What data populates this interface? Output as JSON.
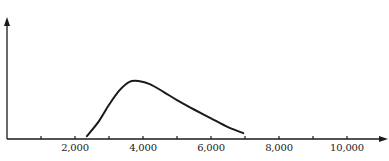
{
  "chart_data": {
    "type": "line",
    "title": "",
    "xlabel": "",
    "ylabel": "",
    "xlim": [
      0,
      11000
    ],
    "ylim": [
      0,
      1
    ],
    "grid": false,
    "legend": null,
    "x_ticks": [
      1000,
      2000,
      3000,
      4000,
      5000,
      6000,
      7000,
      8000,
      9000,
      10000
    ],
    "x_tick_labels": [
      {
        "value": 2000,
        "label": "2,000"
      },
      {
        "value": 4000,
        "label": "4,000"
      },
      {
        "value": 6000,
        "label": "6,000"
      },
      {
        "value": 8000,
        "label": "8,000"
      },
      {
        "value": 10000,
        "label": "10,000"
      }
    ],
    "y_ticks": [],
    "series": [
      {
        "name": "distribution",
        "x": [
          2350,
          2700,
          3000,
          3300,
          3600,
          3900,
          4200,
          4600,
          5000,
          5500,
          6000,
          6500,
          6950
        ],
        "y": [
          0.05,
          0.3,
          0.58,
          0.82,
          0.97,
          0.98,
          0.93,
          0.8,
          0.66,
          0.5,
          0.35,
          0.2,
          0.1
        ]
      }
    ],
    "annotations": []
  },
  "colors": {
    "line": "#1a1a1a",
    "axis": "#1a1a1a",
    "background": "#ffffff"
  }
}
